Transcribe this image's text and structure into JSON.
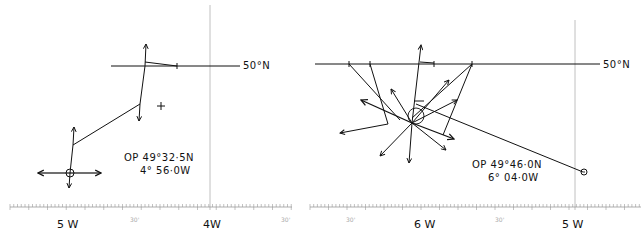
{
  "left_plot": {
    "parallel_label": "50°N",
    "op_line1": "OP 49°32·5N",
    "op_line2": "4° 56·0W",
    "scale_labels": [
      {
        "text": "5 W",
        "x": 68
      },
      {
        "text": "30'",
        "x": 136
      },
      {
        "text": "4W",
        "x": 210
      },
      {
        "text": "30'",
        "x": 286
      }
    ]
  },
  "right_plot": {
    "parallel_label": "50°N",
    "op_line1": "OP 49°46·0N",
    "op_line2": "6° 04·0W",
    "scale_labels": [
      {
        "text": "30'",
        "x": 352
      },
      {
        "text": "6 W",
        "x": 425
      },
      {
        "text": "30'",
        "x": 500
      },
      {
        "text": "5 W",
        "x": 573
      }
    ]
  },
  "colors": {
    "ink": "#111111",
    "grid": "#b0b0b0",
    "background": "#ffffff"
  }
}
